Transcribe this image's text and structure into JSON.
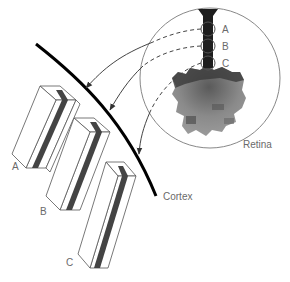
{
  "diagram": {
    "labels": {
      "retina": "Retina",
      "cortex": "Cortex",
      "retina_points": [
        "A",
        "B",
        "C"
      ],
      "columns": [
        "A",
        "B",
        "C"
      ]
    },
    "colors": {
      "line": "#000000",
      "outline": "#555555",
      "stripe": "#444444",
      "label": "#6a6a6a"
    }
  }
}
